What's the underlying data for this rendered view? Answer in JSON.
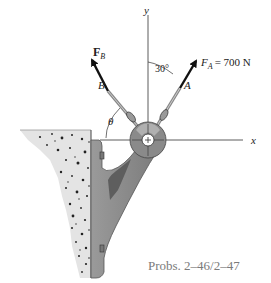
{
  "diagram": {
    "axes": {
      "x_label": "x",
      "y_label": "y"
    },
    "forces": {
      "fa": {
        "symbol": "F",
        "subscript": "A",
        "value_text": "= 700 N",
        "point_label": "A",
        "angle_label": "30°"
      },
      "fb": {
        "symbol": "F",
        "subscript": "B",
        "point_label": "B",
        "angle_label": "θ"
      }
    },
    "caption": "Probs. 2–46/2–47",
    "colors": {
      "bracket": "#8c8c8c",
      "bracket_dark": "#5e5e5e",
      "concrete": "#e4e4e4",
      "arrow": "#111111"
    }
  }
}
